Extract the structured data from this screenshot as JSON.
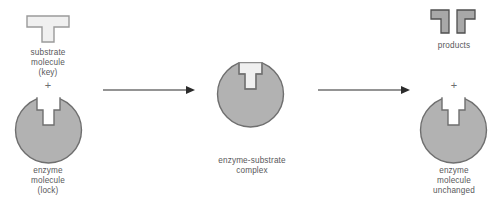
{
  "diagram": {
    "background_color": "#ffffff",
    "colors": {
      "enzyme_fill": "#b2b2b2",
      "enzyme_stroke": "#6f6f6f",
      "substrate_fill": "#f0f0f0",
      "substrate_stroke": "#9a9a9a",
      "product_fill": "#a8a8a8",
      "product_stroke": "#4f4f4f",
      "text": "#58585a",
      "arrow": "#2b2b2b"
    }
  },
  "stage_left": {
    "substrate_label": "substrate\nmolecule\n(key)",
    "plus_sign": "+",
    "enzyme_label": "enzyme\nmolecule\n(lock)",
    "substrate_shape_name": "t-shape-key",
    "enzyme_shape_name": "circle-with-t-notch-lock"
  },
  "arrow_one": {
    "label": "",
    "direction": "right"
  },
  "stage_middle": {
    "complex_label": "enzyme-substrate\ncomplex",
    "complex_shape_name": "enzyme-with-substrate-bound"
  },
  "arrow_two": {
    "label": "",
    "direction": "right"
  },
  "stage_right": {
    "products_label": "products",
    "plus_sign": "+",
    "enzyme_label": "enzyme\nmolecule\nunchanged",
    "product_left_shape_name": "l-shape-product-left",
    "product_right_shape_name": "l-shape-product-right",
    "enzyme_shape_name": "circle-with-t-notch-unchanged"
  }
}
